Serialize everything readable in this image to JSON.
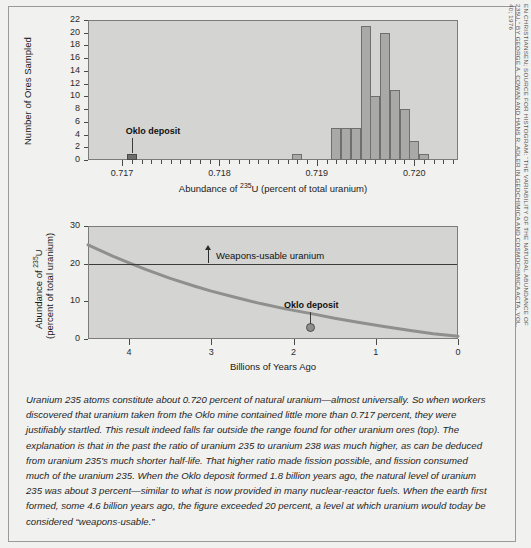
{
  "figure": {
    "background_color": "#f1f1ef",
    "plot_background_color": "#d4d4d2",
    "bar_color": "#a9a9a7",
    "highlight_color": "#6e6e6c"
  },
  "chart_data": [
    {
      "type": "bar",
      "name": "histogram-ore-samples",
      "title": "",
      "xlabel_parts": {
        "pre": "Abundance of ",
        "sup": "235",
        "post": "U (percent of total uranium)"
      },
      "xlabel": "Abundance of 235U (percent of total uranium)",
      "ylabel": "Number of Ores Sampled",
      "xlim": [
        0.71665,
        0.72045
      ],
      "ylim": [
        0,
        22
      ],
      "ytick_labels": [
        "0",
        "2",
        "4",
        "6",
        "8",
        "10",
        "12",
        "14",
        "16",
        "18",
        "20",
        "22"
      ],
      "ytick_values": [
        0,
        2,
        4,
        6,
        8,
        10,
        12,
        14,
        16,
        18,
        20,
        22
      ],
      "xtick_labels": [
        "0.717",
        "0.718",
        "0.719",
        "0.720"
      ],
      "xtick_values": [
        0.717,
        0.718,
        0.719,
        0.72
      ],
      "xminor_step": 0.0001,
      "grid": false,
      "bin_width": 0.0001,
      "bars": [
        {
          "x": 0.7171,
          "value": 1,
          "highlight": true
        },
        {
          "x": 0.7188,
          "value": 1,
          "highlight": false
        },
        {
          "x": 0.7192,
          "value": 5,
          "highlight": false
        },
        {
          "x": 0.7193,
          "value": 5,
          "highlight": false
        },
        {
          "x": 0.7194,
          "value": 5,
          "highlight": false
        },
        {
          "x": 0.7195,
          "value": 21,
          "highlight": false
        },
        {
          "x": 0.7196,
          "value": 10,
          "highlight": false
        },
        {
          "x": 0.7197,
          "value": 20,
          "highlight": false
        },
        {
          "x": 0.7198,
          "value": 11,
          "highlight": false
        },
        {
          "x": 0.7199,
          "value": 8,
          "highlight": false
        },
        {
          "x": 0.72,
          "value": 3,
          "highlight": false
        },
        {
          "x": 0.7201,
          "value": 1,
          "highlight": false
        }
      ],
      "annotations": [
        {
          "label": "Oklo deposit",
          "x": 0.7171,
          "y": 1
        }
      ]
    },
    {
      "type": "line",
      "name": "uranium-235-decay-curve",
      "title": "",
      "xlabel": "Billions of Years Ago",
      "ylabel_line1": "Abundance of 235U",
      "ylabel_line2": "(percent of total uranium)",
      "ylabel": "Abundance of 235U (percent of total uranium)",
      "xlim": [
        4.5,
        0
      ],
      "ylim": [
        0,
        30
      ],
      "x_reversed": true,
      "ytick_labels": [
        "0",
        "10",
        "20",
        "30"
      ],
      "ytick_values": [
        0,
        10,
        20,
        30
      ],
      "xtick_labels": [
        "4",
        "3",
        "2",
        "1",
        "0"
      ],
      "xtick_values": [
        4,
        3,
        2,
        1,
        0
      ],
      "grid": false,
      "series": [
        {
          "name": "Natural abundance of uranium 235",
          "x": [
            4.5,
            4.2,
            4.0,
            3.8,
            3.5,
            3.2,
            3.0,
            2.7,
            2.4,
            2.1,
            1.8,
            1.5,
            1.2,
            0.9,
            0.6,
            0.3,
            0.0
          ],
          "values": [
            25.0,
            22.0,
            20.2,
            18.5,
            16.1,
            14.0,
            12.7,
            11.0,
            9.4,
            8.0,
            6.8,
            5.5,
            4.4,
            3.3,
            2.3,
            1.4,
            0.72
          ]
        }
      ],
      "reference_lines": [
        {
          "label": "Weapons-usable uranium",
          "y": 20,
          "orientation": "horizontal"
        }
      ],
      "annotations": [
        {
          "label": "Oklo deposit",
          "x": 1.8,
          "y": 3.0
        }
      ]
    }
  ],
  "caption": {
    "text": "Uranium 235 atoms constitute about 0.720 percent of natural uranium—almost universally. So when workers discovered that uranium taken from the Oklo mine contained little more than 0.717 percent, they were justifiably startled. This result indeed falls far outside the range found for other uranium ores (top). The explanation is that in the past the ratio of uranium 235 to uranium 238 was much higher, as can be deduced from uranium 235's much shorter half-life. That higher ratio made fission possible, and fission consumed much of the uranium 235. When the Oklo deposit formed 1.8 billion years ago, the natural level of uranium 235 was about 3 percent—similar to what is now provided in many nuclear-reactor fuels. When the earth first formed, some 4.6 billion years ago, the figure exceeded 20 percent, a level at which uranium would today be considered “weapons-usable.”"
  },
  "credit": {
    "text": "EN CHRISTIANSEN; SOURCE FOR HISTOGRAM: “THE VARIABILITY OF THE NATURAL ABUNDANCE OF 235U,” BY GEORGE A. COWAN AND HANS R. ADLER IN GEOCHIMICA AND COSMOCHIMICA ACTA, VOL. 40; 1976"
  }
}
